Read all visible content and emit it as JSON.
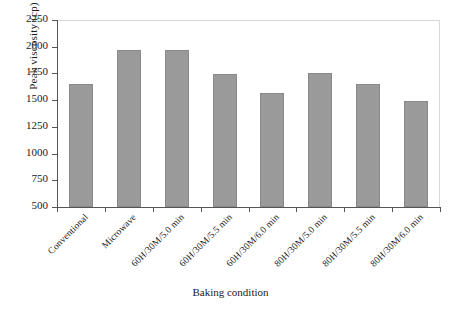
{
  "chart_data": {
    "type": "bar",
    "title": "",
    "xlabel": "Baking condition",
    "ylabel": "Peak viscosity (cp)",
    "ylim": [
      500,
      2250
    ],
    "yticks": [
      500,
      750,
      1000,
      1250,
      1500,
      1750,
      2000,
      2250
    ],
    "grid": false,
    "legend": "none",
    "bar_color": "#9a9a9a",
    "bar_edge_color": "#8a8a8a",
    "axis_color": "#555555",
    "categories": [
      "Conventional",
      "Microwave",
      "60H/30M/5.0 min",
      "60H/30M/5.5 min",
      "60H/30M/6.0 min",
      "80H/30M/5.0 min",
      "80H/30M/5.5 min",
      "80H/30M/6.0 min"
    ],
    "values": [
      1650,
      1965,
      1970,
      1740,
      1565,
      1750,
      1650,
      1495
    ]
  }
}
